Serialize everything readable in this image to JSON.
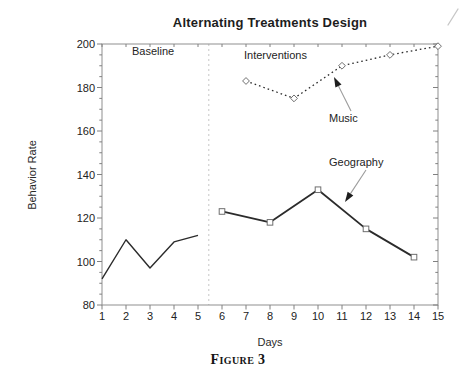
{
  "page": {
    "background": "#ffffff",
    "caption": "Figure 3"
  },
  "colors": {
    "ink": "#2b2b2b",
    "frame": "#8f8f8f",
    "tick": "#808080",
    "tick_label": "#222222",
    "divider": "#c6c6c6",
    "marker_stroke": "#6f6f6f",
    "marker_fill": "#ffffff",
    "arrow_shaft": "#9c9c9c",
    "arrow_head": "#1e1e1e",
    "artifact": "#bdbdbd"
  },
  "chart_data": {
    "type": "line",
    "title": "Alternating Treatments Design",
    "xlabel": "Days",
    "ylabel": "Behavior Rate",
    "xlim": [
      1,
      15
    ],
    "ylim": [
      80,
      200
    ],
    "x_ticks": [
      1,
      2,
      3,
      4,
      5,
      6,
      7,
      8,
      9,
      10,
      11,
      12,
      13,
      14,
      15
    ],
    "y_ticks": [
      80,
      100,
      120,
      140,
      160,
      180,
      200
    ],
    "y_minor_step": 5,
    "grid": false,
    "legend_position": "inline-annotations",
    "phase_divider_day": 5.45,
    "series": [
      {
        "name": "Baseline",
        "line": "solid",
        "marker": "none",
        "x": [
          1,
          2,
          3,
          4,
          5
        ],
        "values": [
          92,
          110,
          97,
          109,
          112
        ]
      },
      {
        "name": "Geography",
        "line": "solid",
        "marker": "open-square",
        "x": [
          6,
          8,
          10,
          12,
          14
        ],
        "values": [
          123,
          118,
          133,
          115,
          102
        ]
      },
      {
        "name": "Music",
        "line": "dotted",
        "marker": "open-diamond",
        "x": [
          7,
          9,
          11,
          13,
          15
        ],
        "values": [
          183,
          175,
          190,
          195,
          199
        ]
      }
    ],
    "annotations": [
      {
        "id": "baseline-phase-label",
        "text": "Baseline",
        "x_px": 132,
        "y_px": 45
      },
      {
        "id": "interventions-phase-label",
        "text": "Interventions",
        "x_px": 244,
        "y_px": 49
      },
      {
        "id": "music-series-label",
        "text": "Music",
        "x_px": 329,
        "y_px": 112
      },
      {
        "id": "geography-series-label",
        "text": "Geography",
        "x_px": 329,
        "y_px": 156
      }
    ],
    "arrows": [
      {
        "id": "music-arrow",
        "from_px": [
          351,
          111
        ],
        "to_px": [
          334,
          77
        ]
      },
      {
        "id": "geography-arrow",
        "from_px": [
          366,
          170
        ],
        "to_px": [
          345,
          202
        ]
      }
    ]
  }
}
